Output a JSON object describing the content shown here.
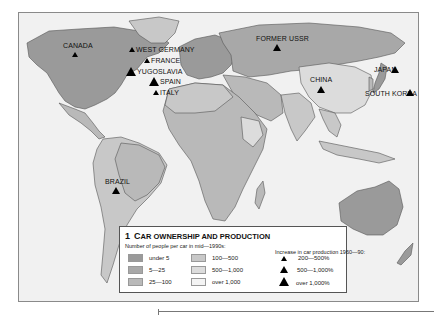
{
  "map": {
    "title_number": "1",
    "title": "Car ownership and production",
    "colors": {
      "ocean": "#f1f1f1",
      "under_5": "#9a9a9a",
      "5_25": "#a8a8a8",
      "25_100": "#b9b9b9",
      "100_500": "#c8c8c8",
      "500_1000": "#dcdcdc",
      "over_1000": "#f4f4f4",
      "border": "#555555"
    },
    "countries": [
      {
        "name": "CANADA",
        "marker": "200-500%"
      },
      {
        "name": "WEST GERMANY",
        "marker": "200-500%"
      },
      {
        "name": "FRANCE",
        "marker": "200-500%"
      },
      {
        "name": "YUGOSLAVIA",
        "marker": "over 1,000%"
      },
      {
        "name": "SPAIN",
        "marker": "over 1,000%"
      },
      {
        "name": "ITALY",
        "marker": "200-500%"
      },
      {
        "name": "FORMER USSR",
        "marker": "500-1,000%"
      },
      {
        "name": "CHINA",
        "marker": "500-1,000%"
      },
      {
        "name": "JAPAN",
        "marker": "500-1,000%"
      },
      {
        "name": "SOUTH KOREA",
        "marker": "500-1,000%"
      },
      {
        "name": "BRAZIL",
        "marker": "500-1,000%"
      }
    ]
  },
  "legend": {
    "number": "1",
    "title_first": "C",
    "title_rest": "AR OWNERSHIP AND PRODUCTION",
    "ownership_heading": "Number of people per car in mid—1990s:",
    "ownership": [
      {
        "label": "under 5",
        "color": "#9a9a9a"
      },
      {
        "label": "5—25",
        "color": "#a8a8a8"
      },
      {
        "label": "25—100",
        "color": "#b9b9b9"
      },
      {
        "label": "100—500",
        "color": "#c8c8c8"
      },
      {
        "label": "500—1,000",
        "color": "#dcdcdc"
      },
      {
        "label": "over 1,000",
        "color": "#f4f4f4"
      }
    ],
    "production_heading": "Increase in car production 1960—90:",
    "production": [
      {
        "label": "200—500%",
        "icon": "triangle-small"
      },
      {
        "label": "500—1,000%",
        "icon": "triangle-medium"
      },
      {
        "label": "over 1,000%",
        "icon": "triangle-large"
      }
    ]
  }
}
